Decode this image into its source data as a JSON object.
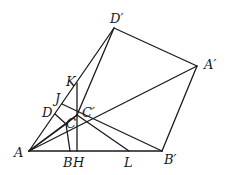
{
  "diagram": {
    "type": "geometry",
    "stroke_color": "#1a1a1a",
    "points": {
      "A": [
        29,
        151
      ],
      "B": [
        70,
        151
      ],
      "H": [
        77,
        151
      ],
      "L": [
        129,
        151
      ],
      "Bp": [
        162,
        151
      ],
      "Ap": [
        197,
        66
      ],
      "Dp": [
        114,
        28
      ],
      "K": [
        77,
        83
      ],
      "Cp": [
        77,
        115
      ],
      "D": [
        55,
        114
      ],
      "J": [
        62,
        104
      ],
      "C": [
        66,
        124
      ]
    },
    "labels": {
      "A": "A",
      "B": "B",
      "H": "H",
      "L": "L",
      "Bp": "B′",
      "Ap": "A′",
      "Dp": "D′",
      "K": "K",
      "J": "J",
      "D": "D",
      "Cp": "C′",
      "C": "C"
    }
  }
}
